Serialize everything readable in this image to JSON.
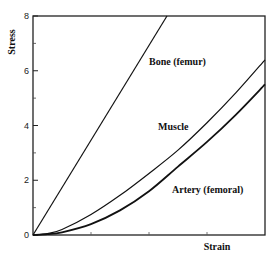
{
  "chart_data": {
    "type": "line",
    "title": "",
    "xlabel": "Strain",
    "ylabel": "Stress",
    "xlim": [
      0,
      4
    ],
    "ylim": [
      0,
      8
    ],
    "x_ticks": [
      0,
      1,
      2,
      3,
      4
    ],
    "x_tick_labels": [],
    "y_ticks": [
      0,
      2,
      4,
      6,
      8
    ],
    "y_tick_labels": [
      "0",
      "2",
      "4",
      "6",
      "8"
    ],
    "y_minor_ticks": [
      1,
      3,
      5,
      7
    ],
    "grid": false,
    "legend": "inline labels",
    "series": [
      {
        "name": "Bone (femur)",
        "x": [
          0,
          2.31
        ],
        "y": [
          0,
          8
        ],
        "stroke_width": 1.2
      },
      {
        "name": "Muscle",
        "x": [
          0,
          0.25,
          0.5,
          1.0,
          1.5,
          2.0,
          2.5,
          3.0,
          3.5,
          4.0
        ],
        "y": [
          0,
          0.05,
          0.2,
          0.75,
          1.45,
          2.25,
          3.1,
          4.1,
          5.2,
          6.4
        ],
        "stroke_width": 1.2
      },
      {
        "name": "Artery (femoral)",
        "x": [
          0,
          0.25,
          0.5,
          1.0,
          1.5,
          2.0,
          2.5,
          3.0,
          3.5,
          4.0
        ],
        "y": [
          0,
          0.03,
          0.1,
          0.4,
          0.9,
          1.6,
          2.5,
          3.4,
          4.4,
          5.5
        ],
        "stroke_width": 1.8
      }
    ],
    "annotations": [
      {
        "text": "Bone (femur)",
        "x": 2.0,
        "y": 6.3
      },
      {
        "text": "Muscle",
        "x": 2.15,
        "y": 4.0
      },
      {
        "text": "Artery (femoral)",
        "x": 2.4,
        "y": 1.6
      }
    ]
  },
  "labels": {
    "xlabel": "Strain",
    "ylabel": "Stress",
    "bone": "Bone (femur)",
    "muscle": "Muscle",
    "artery": "Artery (femoral)"
  }
}
